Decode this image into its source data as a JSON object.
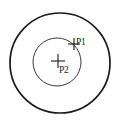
{
  "diagram": {
    "background_color": "#ffffff",
    "stroke_color": "#1a1a1a",
    "inner_stroke_color": "#3a3a3a",
    "shapes": {
      "outer_circle": {
        "name": "outer-circle",
        "cx": 60,
        "cy": 63,
        "r": 50,
        "stroke_width": 1.7
      },
      "inner_circle": {
        "name": "inner-circle",
        "cx": 57,
        "cy": 62,
        "r": 24,
        "stroke_width": 1.0
      }
    },
    "points": [
      {
        "id": "P1",
        "label": "P1",
        "marker": "cross-marker",
        "x": 74,
        "y": 44,
        "arm": 6,
        "label_x": 76,
        "label_y": 45,
        "description": "point on inner circle upper-right arc"
      },
      {
        "id": "P2",
        "label": "P2",
        "marker": "cross-marker",
        "x": 58,
        "y": 61,
        "arm": 7,
        "label_x": 59,
        "label_y": 73,
        "description": "center point of inner circle"
      }
    ]
  }
}
